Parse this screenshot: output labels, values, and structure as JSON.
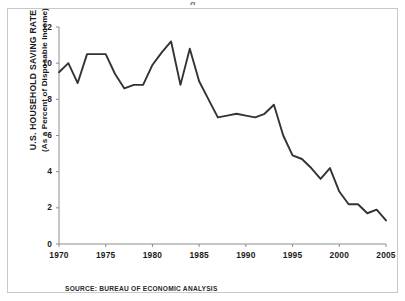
{
  "figure": {
    "source_note": "SOURCE: BUREAU OF ECONOMIC ANALYSIS",
    "frame_color": "#c9c9c9",
    "background_color": "#ffffff",
    "clipped_title_fragment": "g"
  },
  "chart_data": {
    "type": "line",
    "title": "",
    "xlabel": "",
    "ylabel": "U.S. HOUSEHOLD SAVING RATE (As a Percent of Disposable Income)",
    "ylabel_line1": "U.S. HOUSEHOLD SAVING RATE",
    "ylabel_line2": "(As a Percent of Disposable Income)",
    "xlim": [
      1970,
      2005
    ],
    "ylim": [
      0,
      12
    ],
    "grid": false,
    "legend": "none",
    "line_color": "#333333",
    "xticks": [
      1970,
      1975,
      1980,
      1985,
      1990,
      1995,
      2000,
      2005
    ],
    "xtick_labels": [
      "1970",
      "1975",
      "1980",
      "1985",
      "1990",
      "1995",
      "2000",
      "2005"
    ],
    "yticks": [
      0,
      2,
      4,
      6,
      8,
      10,
      12
    ],
    "ytick_labels": [
      "0",
      "2",
      "4",
      "6",
      "8",
      "10",
      "12"
    ],
    "x": [
      1970,
      1971,
      1972,
      1973,
      1974,
      1975,
      1976,
      1977,
      1978,
      1979,
      1980,
      1981,
      1982,
      1983,
      1984,
      1985,
      1986,
      1987,
      1988,
      1989,
      1990,
      1991,
      1992,
      1993,
      1994,
      1995,
      1996,
      1997,
      1998,
      1999,
      2000,
      2001,
      2002,
      2003,
      2004,
      2005
    ],
    "values": [
      9.5,
      10.0,
      8.9,
      10.5,
      10.5,
      10.5,
      9.4,
      8.6,
      8.8,
      8.8,
      9.9,
      10.6,
      11.2,
      8.8,
      10.8,
      9.0,
      8.0,
      7.0,
      7.1,
      7.2,
      7.1,
      7.0,
      7.2,
      7.7,
      6.0,
      4.9,
      4.7,
      4.2,
      3.6,
      4.2,
      2.9,
      2.2,
      2.2,
      1.7,
      1.9,
      1.3
    ],
    "series": [
      {
        "name": "U.S. Household Saving Rate",
        "values": [
          9.5,
          10.0,
          8.9,
          10.5,
          10.5,
          10.5,
          9.4,
          8.6,
          8.8,
          8.8,
          9.9,
          10.6,
          11.2,
          8.8,
          10.8,
          9.0,
          8.0,
          7.0,
          7.1,
          7.2,
          7.1,
          7.0,
          7.2,
          7.7,
          6.0,
          4.9,
          4.7,
          4.2,
          3.6,
          4.2,
          2.9,
          2.2,
          2.2,
          1.7,
          1.9,
          1.3
        ]
      }
    ]
  }
}
